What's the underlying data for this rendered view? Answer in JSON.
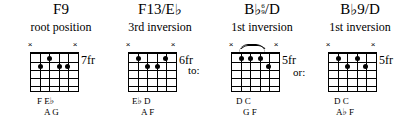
{
  "page": {
    "background": "#ffffff",
    "ink": "#000000"
  },
  "connectors": [
    {
      "name": "to",
      "label": "to:",
      "x": 188,
      "y": 64
    },
    {
      "name": "or",
      "label": "or:",
      "x": 293,
      "y": 66
    }
  ],
  "chords": [
    {
      "id": "f9-root-position",
      "title_pre": "F9",
      "title_post": "",
      "has_flat": false,
      "has_stack": false,
      "subtitle": "root position",
      "fret_label": "7fr",
      "barre": false,
      "x_markers": [
        6,
        1
      ],
      "dots": [
        {
          "string": 5,
          "fret": 2
        },
        {
          "string": 4,
          "fret": 1
        },
        {
          "string": 3,
          "fret": 2
        },
        {
          "string": 2,
          "fret": 2
        },
        {
          "string": 1,
          "fret": 2
        }
      ],
      "notes_top": "F  E♭",
      "notes_bottom": "A   G"
    },
    {
      "id": "f13-eb-3rd-inversion",
      "title_pre": "F13/E",
      "title_post": "",
      "has_flat": true,
      "has_stack": false,
      "subtitle": "3rd inversion",
      "fret_label": "6fr",
      "barre": false,
      "x_markers": [
        6,
        1
      ],
      "dots": [
        {
          "string": 5,
          "fret": 1
        },
        {
          "string": 4,
          "fret": 2
        },
        {
          "string": 3,
          "fret": 2
        },
        {
          "string": 2,
          "fret": 1
        }
      ],
      "notes_top": "E♭  D",
      "notes_bottom": "A   F"
    },
    {
      "id": "bb69-d-1st-inversion",
      "title_pre": "B",
      "title_post": "/D",
      "has_flat": true,
      "has_stack": true,
      "stack_top": "6",
      "stack_bottom": "9",
      "subtitle": "1st inversion",
      "fret_label": "5fr",
      "barre": true,
      "x_markers": [
        6,
        1
      ],
      "dots": [
        {
          "string": 5,
          "fret": 1
        },
        {
          "string": 4,
          "fret": 1
        },
        {
          "string": 3,
          "fret": 1
        },
        {
          "string": 2,
          "fret": 2
        }
      ],
      "notes_top": "D   C",
      "notes_bottom": "G   F"
    },
    {
      "id": "bb9-d-1st-inversion",
      "title_pre": "B",
      "title_post": "9/D",
      "has_flat": true,
      "has_stack": false,
      "subtitle": "1st inversion",
      "fret_label": "5fr",
      "barre": false,
      "x_markers": [
        6,
        1
      ],
      "dots": [
        {
          "string": 5,
          "fret": 1
        },
        {
          "string": 4,
          "fret": 2
        },
        {
          "string": 3,
          "fret": 1
        },
        {
          "string": 2,
          "fret": 2
        }
      ],
      "notes_top": "D   C",
      "notes_bottom": "A♭  F"
    }
  ],
  "layout": {
    "chord_x": [
      11,
      110,
      212,
      310
    ],
    "grid_offset_x": [
      19,
      18,
      19,
      18
    ],
    "grid_offset_y": 52,
    "fretlabel_offset_x": 51,
    "fretlabel_offset_y": 54,
    "notes_top_y": 96,
    "notes_bottom_y": 107
  }
}
